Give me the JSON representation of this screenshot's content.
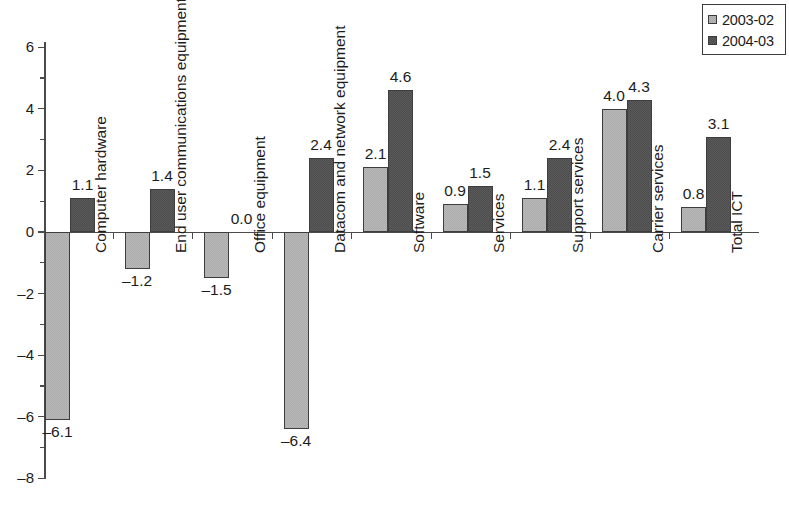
{
  "legend": {
    "position": "top-right",
    "entries": [
      {
        "label": "2003-02",
        "swatch": "light-gray-square",
        "color": "#b9b9b9"
      },
      {
        "label": "2004-03",
        "swatch": "dark-gray-square",
        "color": "#5c5c5c"
      }
    ]
  },
  "axis": {
    "y_ticks": [
      "6",
      "4",
      "2",
      "0",
      "-2",
      "-4",
      "-6",
      "-8"
    ],
    "y_tick_display": [
      "6",
      "4",
      "2",
      "0",
      "–2",
      "–4",
      "–6",
      "–8"
    ]
  },
  "chart_data": {
    "type": "bar",
    "title": "",
    "subtitle": "",
    "xlabel": "",
    "ylabel": "",
    "ylim": [
      -8,
      6
    ],
    "grid": false,
    "legend_position": "top-right",
    "categories": [
      "Computer hardware",
      "End user communications equipment",
      "Office equipment",
      "Datacom and network equipment",
      "Software",
      "Services",
      "Support services",
      "Carrier services",
      "Total ICT"
    ],
    "series": [
      {
        "name": "2003-02",
        "color": "#b9b9b9",
        "values": [
          -6.1,
          -1.2,
          -1.5,
          -6.4,
          2.1,
          0.9,
          1.1,
          4.0,
          0.8
        ],
        "labels": [
          "–6.1",
          "–1.2",
          "–1.5",
          "–6.4",
          "2.1",
          "0.9",
          "1.1",
          "4.0",
          "0.8"
        ]
      },
      {
        "name": "2004-03",
        "color": "#5c5c5c",
        "values": [
          1.1,
          1.4,
          0.0,
          2.4,
          4.6,
          1.5,
          2.4,
          4.3,
          3.1
        ],
        "labels": [
          "1.1",
          "1.4",
          "0.0",
          "2.4",
          "4.6",
          "1.5",
          "2.4",
          "4.3",
          "3.1"
        ]
      }
    ]
  }
}
